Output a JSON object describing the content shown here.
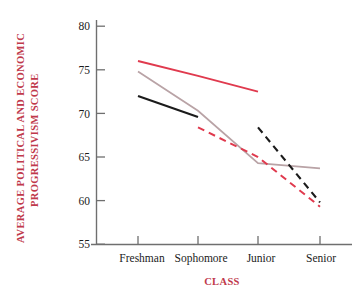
{
  "chart_data": {
    "type": "line",
    "title": "",
    "xlabel": "CLASS",
    "ylabel": "AVERAGE POLITICAL AND ECONOMIC PROGRESSIVISM SCORE",
    "categories": [
      "Freshman",
      "Sophomore",
      "Junior",
      "Senior"
    ],
    "yticks": [
      "55",
      "60",
      "65",
      "70",
      "75",
      "80"
    ],
    "ylim": [
      55,
      80
    ],
    "grid": false,
    "legend": "none",
    "colors": {
      "red": "#e03a4e",
      "pink_gray": "#b9a3a6",
      "black": "#1b1b1b",
      "label_red": "#c0394b",
      "axis_gray": "#6f6f6f"
    },
    "series": [
      {
        "name": "solid-red",
        "color": "#e03a4e",
        "style": "solid",
        "width": 2.0,
        "x": [
          "Freshman",
          "Sophomore",
          "Junior"
        ],
        "values": [
          76.0,
          74.3,
          72.5
        ]
      },
      {
        "name": "pink-gray",
        "color": "#b9a3a6",
        "style": "solid",
        "width": 1.7,
        "x": [
          "Freshman",
          "Sophomore",
          "Junior",
          "Senior"
        ],
        "values": [
          74.8,
          70.3,
          64.3,
          63.7
        ]
      },
      {
        "name": "solid-black",
        "color": "#1b1b1b",
        "style": "solid",
        "width": 2.1,
        "x": [
          "Freshman",
          "Sophomore"
        ],
        "values": [
          72.0,
          69.6
        ]
      },
      {
        "name": "dashed-black",
        "color": "#1b1b1b",
        "style": "dashed",
        "width": 2.1,
        "x": [
          "Junior",
          "Senior"
        ],
        "values": [
          68.4,
          59.8
        ]
      },
      {
        "name": "dashed-red",
        "color": "#e03a4e",
        "style": "dashed",
        "width": 2.0,
        "x": [
          "Sophomore",
          "Junior",
          "Senior"
        ],
        "values": [
          68.4,
          65.0,
          59.3
        ]
      }
    ]
  },
  "axes": {
    "y_tick_55": "55",
    "y_tick_60": "60",
    "y_tick_65": "65",
    "y_tick_70": "70",
    "y_tick_75": "75",
    "y_tick_80": "80",
    "x_tick_1": "Freshman",
    "x_tick_2": "Sophomore",
    "x_tick_3": "Junior",
    "x_tick_4": "Senior",
    "y_title_line1": "AVERAGE POLITICAL AND ECONOMIC",
    "y_title_line2": "PROGRESSIVISM SCORE",
    "x_title": "CLASS"
  }
}
